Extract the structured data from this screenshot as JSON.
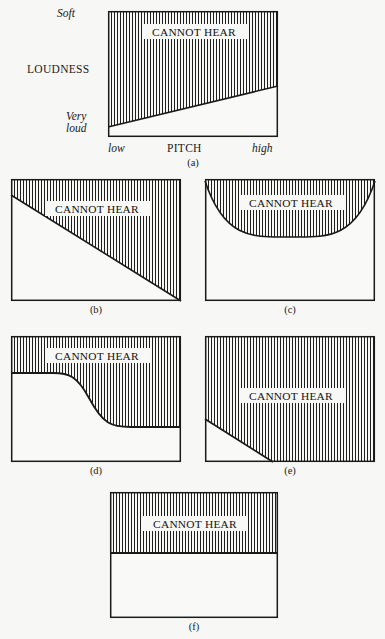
{
  "figure": {
    "background_color": "#f7f7f5",
    "line_color": "#1a1a1a",
    "hatch_color": "#1f1f1f",
    "hatch_spacing_px": 3,
    "region_label": "CANNOT HEAR"
  },
  "axes": {
    "y_label": "LOUDNESS",
    "y_top": "Soft",
    "y_bottom_line1": "Very",
    "y_bottom_line2": "loud",
    "x_label": "PITCH",
    "x_left": "low",
    "x_right": "high"
  },
  "panels": [
    {
      "id": "a",
      "caption": "(a)",
      "region_label": "CANNOT HEAR",
      "shape": "rising-diagonal",
      "description": "Hatched region above a line rising from lower-left to upper-right",
      "has_axes_labels": true
    },
    {
      "id": "b",
      "caption": "(b)",
      "region_label": "CANNOT HEAR",
      "shape": "falling-diagonal",
      "description": "Hatched region above a line falling from upper-left to lower-right",
      "has_axes_labels": false
    },
    {
      "id": "c",
      "caption": "(c)",
      "region_label": "CANNOT HEAR",
      "shape": "u-curve",
      "description": "Hatched region above a U-shaped curve dipping in the middle",
      "has_axes_labels": false
    },
    {
      "id": "d",
      "caption": "(d)",
      "region_label": "CANNOT HEAR",
      "shape": "s-curve-descending",
      "description": "Hatched region above a sigmoid curve that drops in the middle",
      "has_axes_labels": false
    },
    {
      "id": "e",
      "caption": "(e)",
      "region_label": "CANNOT HEAR",
      "shape": "corner-diagonal",
      "description": "Hatched region covering all but a small triangle at the lower-left",
      "has_axes_labels": false
    },
    {
      "id": "f",
      "caption": "(f)",
      "region_label": "CANNOT HEAR",
      "shape": "horizontal-band",
      "description": "Hatched horizontal band across the top of the box",
      "has_axes_labels": false
    }
  ]
}
